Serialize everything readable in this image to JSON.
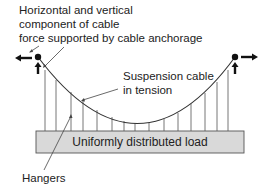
{
  "labels": {
    "anchorage_line1": "Horizontal and vertical",
    "anchorage_line2": "component of cable",
    "anchorage_line3": "force supported by cable anchorage",
    "cable_line1": "Suspension cable",
    "cable_line2": "in tension",
    "deck": "Uniformly distributed load",
    "hangers": "Hangers"
  },
  "colors": {
    "deck_fill": "#d9d9d9",
    "line": "#333333",
    "hanger": "#666666"
  }
}
